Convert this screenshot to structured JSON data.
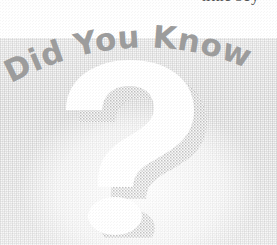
{
  "page": {
    "width": 277,
    "height": 245,
    "kind": "scanned-book-page-fragment"
  },
  "body_text": {
    "cutoff_line": "little boy"
  },
  "callout": {
    "heading": "Did You Know",
    "heading_words": [
      "Did",
      "You",
      "Know"
    ],
    "symbol": "?",
    "symbol_name": "question-mark",
    "style": "arched-banner-watermark"
  },
  "colors": {
    "page_background": "#ffffff",
    "panel_background": "#f4f4f4",
    "panel_texture": "#b4b4b4",
    "heading_text": "#9c9c9c",
    "body_text": "#4a4a4a",
    "question_mark_fill": "#ffffff",
    "question_mark_shadow": "#c9c9c9"
  }
}
